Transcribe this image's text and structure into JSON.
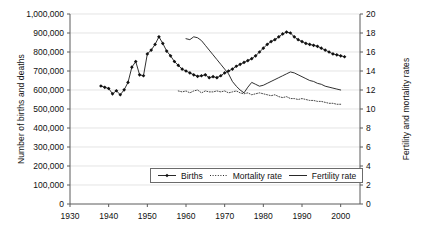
{
  "chart_data": {
    "type": "line",
    "title": "",
    "xlabel": "",
    "ylabel": "Number of births and deaths",
    "y2label": "Fertility and mortality rates",
    "xlim": [
      1930,
      2005
    ],
    "ylim": [
      0,
      1000000
    ],
    "y2lim": [
      0,
      20
    ],
    "grid": true,
    "legend_position": "bottom-center",
    "x_ticks": [
      "1930",
      "1940",
      "1950",
      "1960",
      "1970",
      "1980",
      "1990",
      "2000"
    ],
    "x_tick_values": [
      1930,
      1940,
      1950,
      1960,
      1970,
      1980,
      1990,
      2000
    ],
    "y_ticks": [
      "0",
      "100,000",
      "200,000",
      "300,000",
      "400,000",
      "500,000",
      "600,000",
      "700,000",
      "800,000",
      "900,000",
      "1,000,000"
    ],
    "y_tick_values": [
      0,
      100000,
      200000,
      300000,
      400000,
      500000,
      600000,
      700000,
      800000,
      900000,
      1000000
    ],
    "y2_ticks": [
      "0",
      "2",
      "4",
      "6",
      "8",
      "10",
      "12",
      "14",
      "16",
      "18",
      "20"
    ],
    "y2_tick_values": [
      0,
      2,
      4,
      6,
      8,
      10,
      12,
      14,
      16,
      18,
      20
    ],
    "series": [
      {
        "name": "Births",
        "axis": "left",
        "marker": "diamond",
        "style": "solid-with-markers",
        "x": [
          1938,
          1939,
          1940,
          1941,
          1942,
          1943,
          1944,
          1945,
          1946,
          1947,
          1948,
          1949,
          1950,
          1951,
          1952,
          1953,
          1954,
          1955,
          1956,
          1957,
          1958,
          1959,
          1960,
          1961,
          1962,
          1963,
          1964,
          1965,
          1966,
          1967,
          1968,
          1969,
          1970,
          1971,
          1972,
          1973,
          1974,
          1975,
          1976,
          1977,
          1978,
          1979,
          1980,
          1981,
          1982,
          1983,
          1984,
          1985,
          1986,
          1987,
          1988,
          1989,
          1990,
          1991,
          1992,
          1993,
          1994,
          1995,
          1996,
          1997,
          1998,
          1999,
          2000,
          2001
        ],
        "y": [
          621000,
          614000,
          608000,
          580000,
          596000,
          575000,
          601000,
          640000,
          720000,
          750000,
          680000,
          675000,
          790000,
          810000,
          840000,
          880000,
          845000,
          805000,
          780000,
          750000,
          730000,
          710000,
          700000,
          690000,
          680000,
          672000,
          675000,
          680000,
          665000,
          670000,
          665000,
          675000,
          690000,
          700000,
          710000,
          725000,
          735000,
          745000,
          755000,
          765000,
          780000,
          800000,
          820000,
          840000,
          855000,
          865000,
          880000,
          895000,
          905000,
          900000,
          880000,
          865000,
          855000,
          845000,
          840000,
          835000,
          830000,
          820000,
          810000,
          800000,
          790000,
          785000,
          780000,
          775000
        ]
      },
      {
        "name": "Mortality rate",
        "axis": "right",
        "marker": "none",
        "style": "dotted",
        "x": [
          1958,
          1959,
          1960,
          1961,
          1962,
          1963,
          1964,
          1965,
          1966,
          1967,
          1968,
          1969,
          1970,
          1971,
          1972,
          1973,
          1974,
          1975,
          1976,
          1977,
          1978,
          1979,
          1980,
          1981,
          1982,
          1983,
          1984,
          1985,
          1986,
          1987,
          1988,
          1989,
          1990,
          1991,
          1992,
          1993,
          1994,
          1995,
          1996,
          1997,
          1998,
          1999,
          2000
        ],
        "y": [
          11.9,
          11.8,
          11.9,
          11.7,
          11.9,
          12.0,
          11.7,
          11.9,
          11.8,
          11.8,
          11.9,
          11.8,
          11.9,
          11.7,
          11.8,
          11.9,
          11.7,
          11.6,
          11.7,
          11.5,
          11.6,
          11.7,
          11.6,
          11.5,
          11.4,
          11.5,
          11.3,
          11.2,
          11.3,
          11.1,
          11.1,
          11.0,
          11.1,
          11.0,
          10.9,
          10.9,
          10.8,
          10.8,
          10.7,
          10.6,
          10.6,
          10.5,
          10.5
        ]
      },
      {
        "name": "Fertility rate",
        "axis": "right",
        "marker": "none",
        "style": "solid",
        "x": [
          1960,
          1961,
          1962,
          1963,
          1964,
          1965,
          1966,
          1967,
          1968,
          1969,
          1970,
          1971,
          1972,
          1973,
          1974,
          1975,
          1976,
          1977,
          1978,
          1979,
          1980,
          1981,
          1982,
          1983,
          1984,
          1985,
          1986,
          1987,
          1988,
          1989,
          1990,
          1991,
          1992,
          1993,
          1994,
          1995,
          1996,
          1997,
          1998,
          1999,
          2000
        ],
        "y": [
          17.4,
          17.3,
          17.6,
          17.5,
          17.2,
          16.7,
          16.2,
          15.7,
          15.2,
          14.7,
          14.2,
          13.7,
          12.9,
          12.4,
          12.0,
          11.7,
          12.3,
          12.8,
          12.6,
          12.4,
          12.5,
          12.7,
          12.9,
          13.1,
          13.3,
          13.5,
          13.7,
          13.9,
          13.8,
          13.6,
          13.4,
          13.2,
          13.0,
          12.9,
          12.7,
          12.6,
          12.4,
          12.3,
          12.2,
          12.1,
          12.0
        ]
      }
    ]
  },
  "legend": {
    "items": [
      {
        "label": "Births",
        "style": "solid-with-markers"
      },
      {
        "label": "Mortality rate",
        "style": "dotted"
      },
      {
        "label": "Fertility rate",
        "style": "solid"
      }
    ]
  },
  "axes": {
    "left_title": "Number of births and deaths",
    "right_title": "Fertility and mortality rates"
  }
}
